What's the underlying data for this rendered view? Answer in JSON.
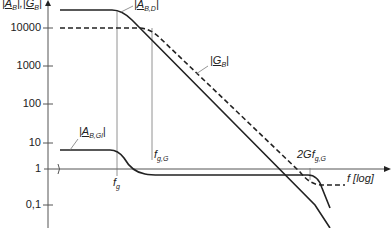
{
  "diagram": {
    "y_axis": {
      "label_A": "A",
      "label_A_sub": "B",
      "label_G": "G",
      "label_G_sub": "B",
      "ticks": [
        "10000",
        "1000",
        "100",
        "10",
        "1",
        "0,1"
      ]
    },
    "x_axis": {
      "label": "f [log]",
      "markers": {
        "fg": "f",
        "fg_sub": "g",
        "fgG": "f",
        "fgG_sub": "g,G",
        "twoGfgG": "2Gf",
        "twoGfgG_sub": "g,G"
      }
    },
    "curves": {
      "ABD": {
        "name": "A",
        "sub": "B,D",
        "style": "solid"
      },
      "GB": {
        "name": "G",
        "sub": "B",
        "style": "dashed"
      },
      "ABGl": {
        "name": "A",
        "sub": "B,Gl",
        "style": "solid"
      }
    },
    "colors": {
      "line": "#222222",
      "axis": "#555555",
      "text": "#333333"
    }
  }
}
